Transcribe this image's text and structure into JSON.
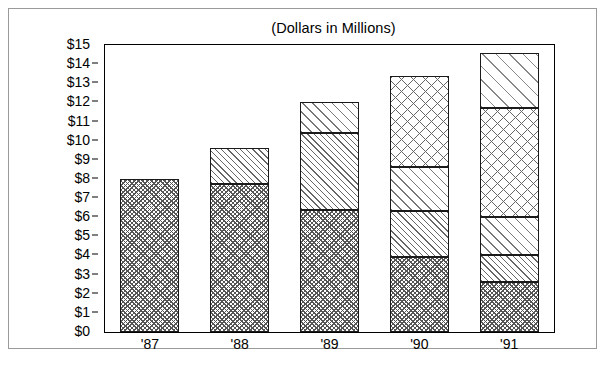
{
  "chart_data": {
    "type": "bar",
    "stacked": true,
    "title": "(Dollars in Millions)",
    "xlabel": "",
    "ylabel": "",
    "categories": [
      "'87",
      "'88",
      "'89",
      "'90",
      "'91"
    ],
    "ylim": [
      0,
      15
    ],
    "y_ticks": [
      0,
      1,
      2,
      3,
      4,
      5,
      6,
      7,
      8,
      9,
      10,
      11,
      12,
      13,
      14,
      15
    ],
    "y_tick_labels": [
      "$0",
      "$1",
      "$2",
      "$3",
      "$4",
      "$5",
      "$6",
      "$7",
      "$8",
      "$9",
      "$10",
      "$11",
      "$12",
      "$13",
      "$14",
      "$15"
    ],
    "grid": false,
    "legend": "none",
    "series": [
      {
        "name": "Segment 1",
        "pattern": "checker",
        "values": [
          8.0,
          7.75,
          6.4,
          3.9,
          2.6
        ]
      },
      {
        "name": "Segment 2",
        "pattern": "diag-dense",
        "values": [
          0,
          1.85,
          4.0,
          2.4,
          1.4
        ]
      },
      {
        "name": "Segment 3",
        "pattern": "diag-light",
        "values": [
          0,
          0,
          1.6,
          2.3,
          2.0
        ]
      },
      {
        "name": "Segment 4",
        "pattern": "cross-big",
        "values": [
          0,
          0,
          0,
          4.8,
          5.7
        ]
      },
      {
        "name": "Segment 5",
        "pattern": "diag-wide",
        "values": [
          0,
          0,
          0,
          0,
          2.9
        ]
      }
    ],
    "totals": [
      8.0,
      9.6,
      12.0,
      13.4,
      14.6
    ]
  },
  "colors": {
    "frame": "#9a9a9a",
    "axis": "#000000",
    "bar_outline": "#1a1a1a",
    "background": "#ffffff"
  }
}
